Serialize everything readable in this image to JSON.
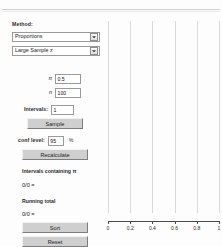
{
  "window": {
    "title": "Confidence Interval Simulation"
  },
  "panel": {
    "method_label": "Method:",
    "method_combo": {
      "selected": "Proportions",
      "arrow_icon": "chevron-down-icon"
    },
    "procedure_combo": {
      "selected": "Large Sample z",
      "arrow_icon": "chevron-down-icon"
    },
    "params": [
      {
        "name": "π",
        "value": "0.5"
      },
      {
        "name": "n",
        "value": "100"
      }
    ],
    "intervals_label": "Intervals:",
    "intervals_value": "1",
    "sample_button": "Sample",
    "conf_level_label": "conf level:",
    "conf_level_value": "95",
    "percent_symbol": "%",
    "recalculate_button": "Recalculate",
    "intervals_containing_label": "Intervals containing π",
    "intervals_containing_value": "0/0 =",
    "running_total_label": "Running total",
    "running_total_value": "0/0 =",
    "sort_button": "Sort",
    "reset_button": "Reset"
  },
  "chart_data": {
    "type": "scatter",
    "title": "",
    "xlabel": "",
    "ylabel": "",
    "xlim": [
      0,
      1
    ],
    "ylim": [
      0,
      1
    ],
    "xticks": [
      0,
      0.2,
      0.4,
      0.6,
      0.8,
      1
    ],
    "xticklabels": [
      "0",
      "0.2",
      "0.4",
      "0.6",
      "0.8",
      "1"
    ],
    "gridlines": [
      0,
      0.2,
      0.4,
      0.6,
      0.8,
      1
    ],
    "grid": true,
    "legend": false,
    "series": [
      {
        "name": "confidence intervals",
        "values": []
      }
    ]
  }
}
